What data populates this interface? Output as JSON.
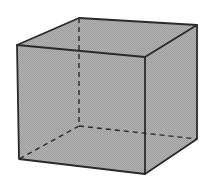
{
  "figure": {
    "title": "Cube with hidden edges dashed",
    "shape": "cube",
    "fill_color": "#a9a9a9",
    "edge_color": "#2a2a2a",
    "hidden_edge_style": "dashed",
    "vertices": {
      "front_top_left": [
        17,
        45
      ],
      "front_top_right": [
        145,
        57
      ],
      "front_bottom_left": [
        19,
        159
      ],
      "front_bottom_right": [
        145,
        174
      ],
      "back_top_left": [
        79,
        18
      ],
      "back_top_right": [
        197,
        25
      ],
      "back_bottom_left": [
        79,
        126
      ],
      "back_bottom_right": [
        197,
        139
      ]
    }
  }
}
